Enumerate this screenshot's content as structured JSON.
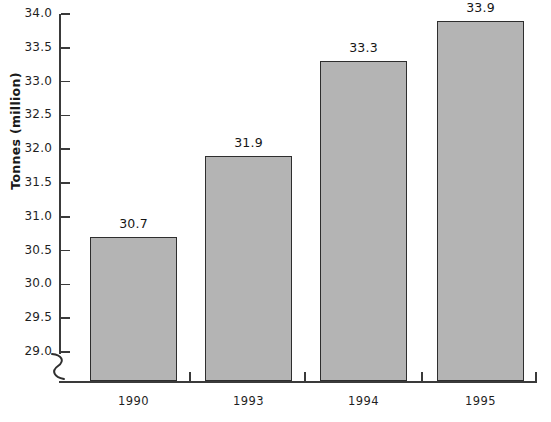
{
  "chart_data": {
    "type": "bar",
    "title": "",
    "subtitle": "",
    "xlabel": "",
    "ylabel": "Tonnes (million)",
    "categories": [
      "1990",
      "1993",
      "1994",
      "1995"
    ],
    "values": [
      30.7,
      31.9,
      33.3,
      33.9
    ],
    "value_labels": [
      "30.7",
      "31.9",
      "33.3",
      "33.9"
    ],
    "series": [
      {
        "name": "Tonnes (million)",
        "values": [
          30.7,
          31.9,
          33.3,
          33.9
        ]
      }
    ],
    "ylim": [
      29.0,
      34.0
    ],
    "ytick_labels": [
      "34.0",
      "33.5",
      "33.0",
      "32.5",
      "32.0",
      "31.5",
      "31.0",
      "30.5",
      "30.0",
      "29.5",
      "29.0"
    ],
    "ytick_values": [
      34.0,
      33.5,
      33.0,
      32.5,
      32.0,
      31.5,
      31.0,
      30.5,
      30.0,
      29.5,
      29.0
    ],
    "ytick_step": 0.5,
    "grid": false,
    "legend": false,
    "legend_position": "none",
    "axis_break": true,
    "axis_break_symbol": "squiggle",
    "annotations": [],
    "bar_fill_color": "#b4b4b4",
    "bar_border_color": "#2e2e2e",
    "axis_color": "#3a3a3a",
    "text_color": "#1f1f1f",
    "background_color": "#ffffff"
  }
}
